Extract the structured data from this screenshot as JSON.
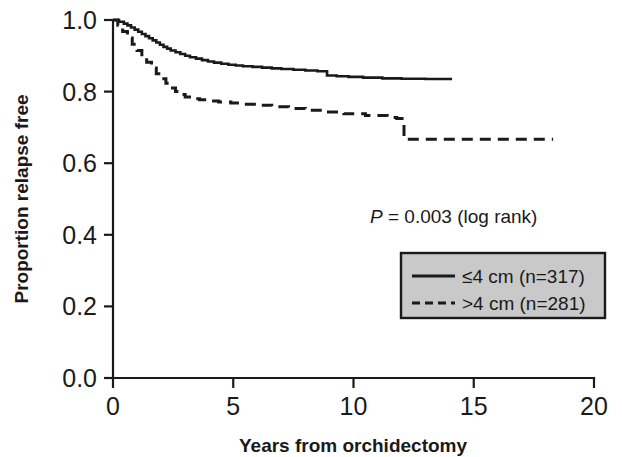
{
  "chart_data": {
    "type": "line",
    "title": "",
    "xlabel": "Years from orchidectomy",
    "ylabel": "Proportion relapse free",
    "xlim": [
      0,
      20
    ],
    "ylim": [
      0.0,
      1.0
    ],
    "xticks": [
      "0",
      "5",
      "10",
      "15",
      "20"
    ],
    "xtick_values": [
      0,
      5,
      10,
      15,
      20
    ],
    "yticks": [
      "0.0",
      "0.2",
      "0.4",
      "0.6",
      "0.8",
      "1.0"
    ],
    "ytick_values": [
      0.0,
      0.2,
      0.4,
      0.6,
      0.8,
      1.0
    ],
    "grid": false,
    "legend_position": "center-right",
    "annotation": {
      "statistic_symbol": "P",
      "statistic_text": " = 0.003 (log rank)",
      "full_text": "P = 0.003 (log rank)"
    },
    "series": [
      {
        "name": "≤4 cm (n=317)",
        "style": "solid",
        "color": "#1a1a1a",
        "x": [
          0.0,
          0.25,
          0.45,
          0.6,
          0.75,
          0.9,
          1.05,
          1.2,
          1.35,
          1.5,
          1.65,
          1.8,
          1.95,
          2.1,
          2.25,
          2.4,
          2.6,
          2.8,
          3.0,
          3.2,
          3.45,
          3.7,
          3.95,
          4.2,
          4.5,
          4.8,
          5.1,
          5.4,
          5.8,
          6.2,
          6.6,
          7.0,
          7.5,
          8.0,
          8.5,
          8.9,
          9.3,
          9.8,
          10.4,
          11.2,
          12.0,
          13.0,
          14.1
        ],
        "y": [
          1.0,
          0.995,
          0.99,
          0.985,
          0.979,
          0.973,
          0.967,
          0.961,
          0.955,
          0.949,
          0.943,
          0.937,
          0.931,
          0.925,
          0.92,
          0.915,
          0.91,
          0.905,
          0.9,
          0.896,
          0.892,
          0.888,
          0.884,
          0.881,
          0.878,
          0.875,
          0.873,
          0.871,
          0.869,
          0.867,
          0.865,
          0.863,
          0.861,
          0.859,
          0.857,
          0.845,
          0.843,
          0.841,
          0.839,
          0.837,
          0.836,
          0.835,
          0.835
        ]
      },
      {
        "name": ">4 cm (n=281)",
        "style": "dashed",
        "color": "#1a1a1a",
        "x": [
          0.0,
          0.2,
          0.4,
          0.6,
          0.8,
          1.0,
          1.2,
          1.4,
          1.6,
          1.8,
          2.0,
          2.2,
          2.4,
          2.6,
          2.8,
          3.0,
          3.3,
          3.6,
          4.0,
          4.4,
          4.9,
          5.4,
          6.0,
          6.6,
          7.3,
          8.0,
          8.8,
          9.6,
          10.5,
          11.4,
          11.8,
          12.1,
          13.0,
          14.5,
          16.0,
          18.3
        ],
        "y": [
          1.0,
          0.985,
          0.968,
          0.95,
          0.932,
          0.915,
          0.898,
          0.882,
          0.866,
          0.85,
          0.836,
          0.823,
          0.81,
          0.8,
          0.792,
          0.785,
          0.78,
          0.777,
          0.774,
          0.771,
          0.768,
          0.765,
          0.762,
          0.758,
          0.753,
          0.748,
          0.743,
          0.738,
          0.733,
          0.728,
          0.725,
          0.667,
          0.667,
          0.667,
          0.667,
          0.667
        ]
      }
    ],
    "legend_entries": [
      {
        "label": "≤4 cm (n=317)",
        "style": "solid"
      },
      {
        "label": ">4 cm (n=281)",
        "style": "dashed"
      }
    ]
  }
}
